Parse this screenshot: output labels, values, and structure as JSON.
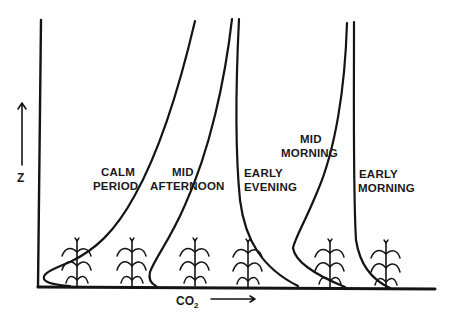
{
  "figure": {
    "type": "diagram",
    "axes": {
      "y_label": "Z",
      "x_label_main": "CO",
      "x_label_sub": "2",
      "y_arrow": "up-arrow",
      "x_arrow": "right-arrow"
    },
    "profiles": [
      {
        "id": "calm-period",
        "line1": "CALM",
        "line2": "PERIOD"
      },
      {
        "id": "mid-afternoon",
        "line1": "MID",
        "line2": "AFTERNOON"
      },
      {
        "id": "early-evening",
        "line1": "EARLY",
        "line2": "EVENING"
      },
      {
        "id": "mid-morning",
        "line1": "MID",
        "line2": "MORNING"
      },
      {
        "id": "early-morning",
        "line1": "EARLY",
        "line2": "MORNING"
      }
    ],
    "plant_icon": "corn-plant-icon",
    "plant_count": 6,
    "colors": {
      "ink": "#141414",
      "background": "#ffffff"
    }
  }
}
